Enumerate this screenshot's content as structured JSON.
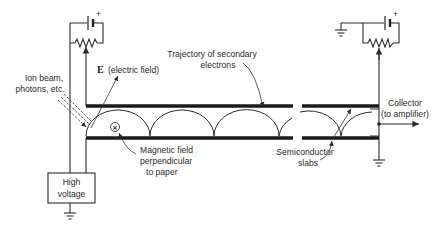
{
  "diagram": {
    "labels": {
      "electric_field_symbol": "E",
      "electric_field": "(electric field)",
      "ion_beam_line1": "Ion beam,",
      "ion_beam_line2": "photons, etc.",
      "trajectory_line1": "Trajectory of secondary",
      "trajectory_line2": "electrons",
      "collector_line1": "Collector",
      "collector_line2": "(to amplifier)",
      "magnetic_line1": "Magnetic field",
      "magnetic_line2": "perpendicular",
      "magnetic_line3": "to paper",
      "semiconductor_line1": "Semiconductor",
      "semiconductor_line2": "slabs",
      "high_voltage_line1": "High",
      "high_voltage_line2": "voltage",
      "battery_plus_left": "+",
      "battery_plus_right": "+",
      "magnetic_symbol": "×"
    },
    "components": [
      "left-battery",
      "left-potentiometer",
      "high-voltage-supply",
      "ground-left",
      "top-semiconductor-slab",
      "bottom-semiconductor-slab",
      "electron-trajectory",
      "incident-beam",
      "collector",
      "right-battery",
      "right-potentiometer",
      "ground-right",
      "ground-collector"
    ],
    "trajectory_arcs": 5
  }
}
